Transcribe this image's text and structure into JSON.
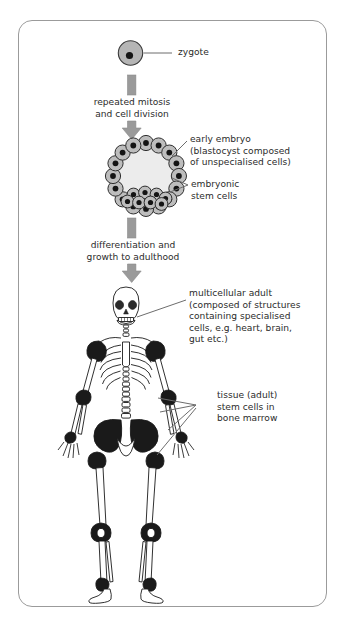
{
  "diagram": {
    "background_color": "#ffffff",
    "frame_color": "#9b9b9b",
    "text_color": "#2b2b2b",
    "arrow_color": "#8f8f8f",
    "cell_fill": "#b3b3b3",
    "nucleus_color": "#1a1a1a",
    "bone_fill": "#ffffff",
    "marrow_color": "#1a1a1a",
    "leader_color": "#555555"
  },
  "stages": {
    "zygote": {
      "label": "zygote",
      "shape": "single-cell-circle"
    },
    "arrow1": {
      "label_line1": "repeated mitosis",
      "label_line2": "and cell division"
    },
    "blastocyst": {
      "label_line1": "early embryo",
      "label_line2": "(blastocyst composed",
      "label_line3": "of unspecialised cells)",
      "inner_label_line1": "embryonic",
      "inner_label_line2": "stem cells"
    },
    "arrow2": {
      "label_line1": "differentiation and",
      "label_line2": "growth to adulthood"
    },
    "adult": {
      "label_line1": "multicellular adult",
      "label_line2": "(composed of structures",
      "label_line3": "containing specialised",
      "label_line4": "cells, e.g. heart, brain,",
      "label_line5": "gut etc.)",
      "marrow_label_line1": "tissue (adult)",
      "marrow_label_line2": "stem cells in",
      "marrow_label_line3": "bone marrow"
    }
  }
}
